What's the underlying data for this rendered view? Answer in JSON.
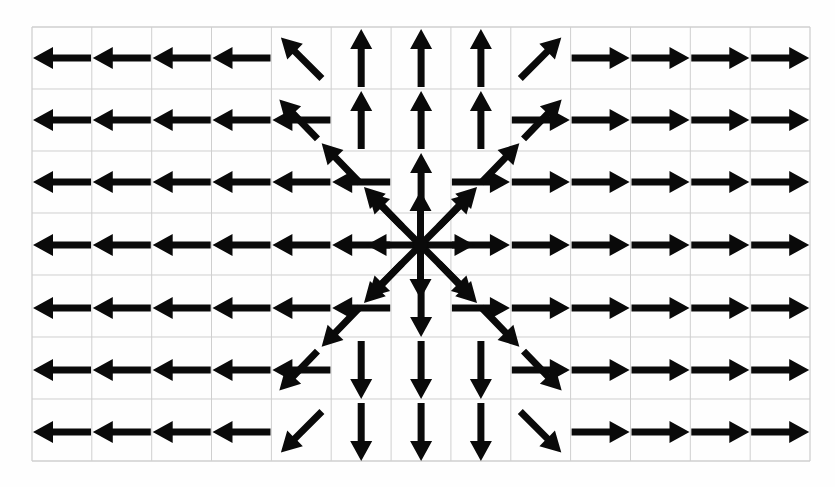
{
  "figure": {
    "width": 835,
    "height": 487,
    "background_color": "#fefefe",
    "arrow_color": "#0a0a0a",
    "grid_color": "#cfcfcf"
  },
  "chart_data": {
    "type": "scatter",
    "subtitle": "Arrows of uniform length point directly away from the central source point",
    "xlabel": "",
    "ylabel": "",
    "grid": true,
    "legend": null,
    "plot_box": {
      "x0": 32,
      "y0": 27,
      "x1": 810,
      "y1": 461
    },
    "grid_spec": {
      "columns": 13,
      "rows": 7,
      "cell_width": 59.85,
      "cell_height": 62.0,
      "x_gridlines": [
        32,
        91.8,
        151.7,
        211.5,
        271.4,
        331.2,
        391.1,
        450.9,
        510.8,
        570.6,
        630.5,
        690.3,
        750.2,
        810
      ],
      "y_gridlines": [
        27,
        89,
        151,
        213,
        275,
        337,
        399,
        461
      ]
    },
    "origin": {
      "x": 420.5,
      "y": 245,
      "col_index": 6.5,
      "row_index": 3.5,
      "label": "source"
    },
    "arrow_length": 58,
    "arrow_head_length": 20,
    "arrow_head_width": 22,
    "arrow_shaft_width": 7,
    "field_description": "Every arrow has identical magnitude and its direction equals the unit vector from the origin to the arrow's tail position, so the pattern is a pure outward source.",
    "vectors": [
      {
        "row": 1,
        "col": 1,
        "x": 62,
        "y": 58,
        "dir": "left",
        "angle": 180
      },
      {
        "row": 1,
        "col": 2,
        "x": 121.8,
        "y": 58,
        "dir": "left",
        "angle": 180
      },
      {
        "row": 1,
        "col": 3,
        "x": 181.7,
        "y": 58,
        "dir": "left",
        "angle": 180
      },
      {
        "row": 1,
        "col": 4,
        "x": 241.5,
        "y": 58,
        "dir": "left",
        "angle": 180
      },
      {
        "row": 1,
        "col": 5,
        "x": 301.4,
        "y": 58,
        "dir": "up-left",
        "angle": 225
      },
      {
        "row": 1,
        "col": 6,
        "x": 361.2,
        "y": 58,
        "dir": "up",
        "angle": 270
      },
      {
        "row": 1,
        "col": 7,
        "x": 421.1,
        "y": 58,
        "dir": "up",
        "angle": 270
      },
      {
        "row": 1,
        "col": 8,
        "x": 480.9,
        "y": 58,
        "dir": "up",
        "angle": 270
      },
      {
        "row": 1,
        "col": 9,
        "x": 540.8,
        "y": 58,
        "dir": "up-right",
        "angle": 315
      },
      {
        "row": 1,
        "col": 10,
        "x": 600.6,
        "y": 58,
        "dir": "right",
        "angle": 0
      },
      {
        "row": 1,
        "col": 11,
        "x": 660.5,
        "y": 58,
        "dir": "right",
        "angle": 0
      },
      {
        "row": 1,
        "col": 12,
        "x": 720.3,
        "y": 58,
        "dir": "right",
        "angle": 0
      },
      {
        "row": 1,
        "col": 13,
        "x": 780.2,
        "y": 58,
        "dir": "right",
        "angle": 0
      },
      {
        "row": 2,
        "col": 1,
        "x": 62,
        "y": 120,
        "dir": "left",
        "angle": 180
      },
      {
        "row": 2,
        "col": 2,
        "x": 121.8,
        "y": 120,
        "dir": "left",
        "angle": 180
      },
      {
        "row": 2,
        "col": 3,
        "x": 181.7,
        "y": 120,
        "dir": "left",
        "angle": 180
      },
      {
        "row": 2,
        "col": 4,
        "x": 241.5,
        "y": 120,
        "dir": "left",
        "angle": 180
      },
      {
        "row": 2,
        "col": 5,
        "x": 301.4,
        "y": 120,
        "dir": "left",
        "angle": 180
      },
      {
        "row": 2,
        "col": 6,
        "x": 361.2,
        "y": 120,
        "dir": "up",
        "angle": 270
      },
      {
        "row": 2,
        "col": 7,
        "x": 421.1,
        "y": 120,
        "dir": "up",
        "angle": 270
      },
      {
        "row": 2,
        "col": 8,
        "x": 480.9,
        "y": 120,
        "dir": "up",
        "angle": 270
      },
      {
        "row": 2,
        "col": 9,
        "x": 540.8,
        "y": 120,
        "dir": "right",
        "angle": 0
      },
      {
        "row": 2,
        "col": 10,
        "x": 600.6,
        "y": 120,
        "dir": "right",
        "angle": 0
      },
      {
        "row": 2,
        "col": 11,
        "x": 660.5,
        "y": 120,
        "dir": "right",
        "angle": 0
      },
      {
        "row": 2,
        "col": 12,
        "x": 720.3,
        "y": 120,
        "dir": "right",
        "angle": 0
      },
      {
        "row": 2,
        "col": 13,
        "x": 780.2,
        "y": 120,
        "dir": "right",
        "angle": 0
      },
      {
        "row": 3,
        "col": 1,
        "x": 62,
        "y": 182,
        "dir": "left",
        "angle": 180
      },
      {
        "row": 3,
        "col": 2,
        "x": 121.8,
        "y": 182,
        "dir": "left",
        "angle": 180
      },
      {
        "row": 3,
        "col": 3,
        "x": 181.7,
        "y": 182,
        "dir": "left",
        "angle": 180
      },
      {
        "row": 3,
        "col": 4,
        "x": 241.5,
        "y": 182,
        "dir": "left",
        "angle": 180
      },
      {
        "row": 3,
        "col": 5,
        "x": 301.4,
        "y": 182,
        "dir": "left",
        "angle": 180
      },
      {
        "row": 3,
        "col": 6,
        "x": 361.2,
        "y": 182,
        "dir": "left",
        "angle": 180
      },
      {
        "row": 3,
        "col": 7,
        "x": 421.1,
        "y": 182,
        "dir": "up",
        "angle": 270
      },
      {
        "row": 3,
        "col": 8,
        "x": 480.9,
        "y": 182,
        "dir": "right",
        "angle": 0
      },
      {
        "row": 3,
        "col": 9,
        "x": 540.8,
        "y": 182,
        "dir": "right",
        "angle": 0
      },
      {
        "row": 3,
        "col": 10,
        "x": 600.6,
        "y": 182,
        "dir": "right",
        "angle": 0
      },
      {
        "row": 3,
        "col": 11,
        "x": 660.5,
        "y": 182,
        "dir": "right",
        "angle": 0
      },
      {
        "row": 3,
        "col": 12,
        "x": 720.3,
        "y": 182,
        "dir": "right",
        "angle": 0
      },
      {
        "row": 3,
        "col": 13,
        "x": 780.2,
        "y": 182,
        "dir": "right",
        "angle": 0
      },
      {
        "row": 4,
        "col": 1,
        "x": 62,
        "y": 245,
        "dir": "left",
        "angle": 180
      },
      {
        "row": 4,
        "col": 2,
        "x": 121.8,
        "y": 245,
        "dir": "left",
        "angle": 180
      },
      {
        "row": 4,
        "col": 3,
        "x": 181.7,
        "y": 245,
        "dir": "left",
        "angle": 180
      },
      {
        "row": 4,
        "col": 4,
        "x": 241.5,
        "y": 245,
        "dir": "left",
        "angle": 180
      },
      {
        "row": 4,
        "col": 5,
        "x": 301.4,
        "y": 245,
        "dir": "left",
        "angle": 180
      },
      {
        "row": 4,
        "col": 6,
        "x": 361.2,
        "y": 245,
        "dir": "left",
        "angle": 180
      },
      {
        "row": 4,
        "col": 8,
        "x": 480.9,
        "y": 245,
        "dir": "right",
        "angle": 0
      },
      {
        "row": 4,
        "col": 9,
        "x": 540.8,
        "y": 245,
        "dir": "right",
        "angle": 0
      },
      {
        "row": 4,
        "col": 10,
        "x": 600.6,
        "y": 245,
        "dir": "right",
        "angle": 0
      },
      {
        "row": 4,
        "col": 11,
        "x": 660.5,
        "y": 245,
        "dir": "right",
        "angle": 0
      },
      {
        "row": 4,
        "col": 12,
        "x": 720.3,
        "y": 245,
        "dir": "right",
        "angle": 0
      },
      {
        "row": 4,
        "col": 13,
        "x": 780.2,
        "y": 245,
        "dir": "right",
        "angle": 0
      },
      {
        "row": 5,
        "col": 1,
        "x": 62,
        "y": 308,
        "dir": "left",
        "angle": 180
      },
      {
        "row": 5,
        "col": 2,
        "x": 121.8,
        "y": 308,
        "dir": "left",
        "angle": 180
      },
      {
        "row": 5,
        "col": 3,
        "x": 181.7,
        "y": 308,
        "dir": "left",
        "angle": 180
      },
      {
        "row": 5,
        "col": 4,
        "x": 241.5,
        "y": 308,
        "dir": "left",
        "angle": 180
      },
      {
        "row": 5,
        "col": 5,
        "x": 301.4,
        "y": 308,
        "dir": "left",
        "angle": 180
      },
      {
        "row": 5,
        "col": 6,
        "x": 361.2,
        "y": 308,
        "dir": "left",
        "angle": 180
      },
      {
        "row": 5,
        "col": 7,
        "x": 421.1,
        "y": 308,
        "dir": "down",
        "angle": 90
      },
      {
        "row": 5,
        "col": 8,
        "x": 480.9,
        "y": 308,
        "dir": "right",
        "angle": 0
      },
      {
        "row": 5,
        "col": 9,
        "x": 540.8,
        "y": 308,
        "dir": "right",
        "angle": 0
      },
      {
        "row": 5,
        "col": 10,
        "x": 600.6,
        "y": 308,
        "dir": "right",
        "angle": 0
      },
      {
        "row": 5,
        "col": 11,
        "x": 660.5,
        "y": 308,
        "dir": "right",
        "angle": 0
      },
      {
        "row": 5,
        "col": 12,
        "x": 720.3,
        "y": 308,
        "dir": "right",
        "angle": 0
      },
      {
        "row": 5,
        "col": 13,
        "x": 780.2,
        "y": 308,
        "dir": "right",
        "angle": 0
      },
      {
        "row": 6,
        "col": 1,
        "x": 62,
        "y": 370,
        "dir": "left",
        "angle": 180
      },
      {
        "row": 6,
        "col": 2,
        "x": 121.8,
        "y": 370,
        "dir": "left",
        "angle": 180
      },
      {
        "row": 6,
        "col": 3,
        "x": 181.7,
        "y": 370,
        "dir": "left",
        "angle": 180
      },
      {
        "row": 6,
        "col": 4,
        "x": 241.5,
        "y": 370,
        "dir": "left",
        "angle": 180
      },
      {
        "row": 6,
        "col": 5,
        "x": 301.4,
        "y": 370,
        "dir": "left",
        "angle": 180
      },
      {
        "row": 6,
        "col": 6,
        "x": 361.2,
        "y": 370,
        "dir": "down",
        "angle": 90
      },
      {
        "row": 6,
        "col": 7,
        "x": 421.1,
        "y": 370,
        "dir": "down",
        "angle": 90
      },
      {
        "row": 6,
        "col": 8,
        "x": 480.9,
        "y": 370,
        "dir": "down",
        "angle": 90
      },
      {
        "row": 6,
        "col": 9,
        "x": 540.8,
        "y": 370,
        "dir": "right",
        "angle": 0
      },
      {
        "row": 6,
        "col": 10,
        "x": 600.6,
        "y": 370,
        "dir": "right",
        "angle": 0
      },
      {
        "row": 6,
        "col": 11,
        "x": 660.5,
        "y": 370,
        "dir": "right",
        "angle": 0
      },
      {
        "row": 6,
        "col": 12,
        "x": 720.3,
        "y": 370,
        "dir": "right",
        "angle": 0
      },
      {
        "row": 6,
        "col": 13,
        "x": 780.2,
        "y": 370,
        "dir": "right",
        "angle": 0
      },
      {
        "row": 7,
        "col": 1,
        "x": 62,
        "y": 432,
        "dir": "left",
        "angle": 180
      },
      {
        "row": 7,
        "col": 2,
        "x": 121.8,
        "y": 432,
        "dir": "left",
        "angle": 180
      },
      {
        "row": 7,
        "col": 3,
        "x": 181.7,
        "y": 432,
        "dir": "left",
        "angle": 180
      },
      {
        "row": 7,
        "col": 4,
        "x": 241.5,
        "y": 432,
        "dir": "left",
        "angle": 180
      },
      {
        "row": 7,
        "col": 5,
        "x": 301.4,
        "y": 432,
        "dir": "down-left",
        "angle": 135
      },
      {
        "row": 7,
        "col": 6,
        "x": 361.2,
        "y": 432,
        "dir": "down",
        "angle": 90
      },
      {
        "row": 7,
        "col": 7,
        "x": 421.1,
        "y": 432,
        "dir": "down",
        "angle": 90
      },
      {
        "row": 7,
        "col": 8,
        "x": 480.9,
        "y": 432,
        "dir": "down",
        "angle": 90
      },
      {
        "row": 7,
        "col": 9,
        "x": 540.8,
        "y": 432,
        "dir": "down-right",
        "angle": 45
      },
      {
        "row": 7,
        "col": 10,
        "x": 600.6,
        "y": 432,
        "dir": "right",
        "angle": 0
      },
      {
        "row": 7,
        "col": 11,
        "x": 660.5,
        "y": 432,
        "dir": "right",
        "angle": 0
      },
      {
        "row": 7,
        "col": 12,
        "x": 720.3,
        "y": 432,
        "dir": "right",
        "angle": 0
      },
      {
        "row": 7,
        "col": 13,
        "x": 780.2,
        "y": 432,
        "dir": "right",
        "angle": 0
      }
    ],
    "center_rays": [
      {
        "dir": "left",
        "angle": 180,
        "length": 54
      },
      {
        "dir": "right",
        "angle": 0,
        "length": 54
      },
      {
        "dir": "up",
        "angle": 270,
        "length": 54
      },
      {
        "dir": "down",
        "angle": 90,
        "length": 54
      },
      {
        "dir": "up-left",
        "angle": 225,
        "length": 74
      },
      {
        "dir": "up-right",
        "angle": 315,
        "length": 74
      },
      {
        "dir": "down-left",
        "angle": 135,
        "length": 74
      },
      {
        "dir": "down-right",
        "angle": 45,
        "length": 74
      }
    ],
    "diagonal_chains": [
      {
        "dir": "up-left",
        "angle": 225,
        "segments": 3,
        "note": "runs from the source toward the upper-left corner region"
      },
      {
        "dir": "up-right",
        "angle": 315,
        "segments": 3,
        "note": "runs from the source toward the upper-right corner region"
      },
      {
        "dir": "down-left",
        "angle": 135,
        "segments": 3,
        "note": "runs from the source toward the lower-left corner region"
      },
      {
        "dir": "down-right",
        "angle": 45,
        "segments": 3,
        "note": "runs from the source toward the lower-right corner region"
      }
    ]
  }
}
